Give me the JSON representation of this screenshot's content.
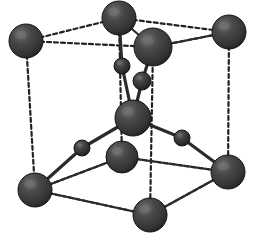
{
  "figure": {
    "name": "crystal-unit-cell-diagram",
    "type": "ball-and-stick-crystal-structure",
    "background_color": "#ffffff",
    "width": 253,
    "height": 237
  },
  "style": {
    "sphere_fill_dark": "#3a3a3a",
    "sphere_fill_mid": "#4a4a4a",
    "sphere_highlight": "#6e6e6e",
    "sphere_shadow": "#1c1c1c",
    "sphere_outline": "#141414",
    "bond_color": "#2b2b2b",
    "edge_dashed_color": "#222222",
    "bond_width": 2.4,
    "edge_width": 2.2,
    "dash_pattern": "4,3"
  },
  "atoms": {
    "large": {
      "label": "large-atom",
      "radius": 17,
      "color": "#3a3a3a",
      "positions": [
        {
          "id": "corner-back-left-top",
          "name": "atom-large-back-left-top",
          "x": 26,
          "y": 41,
          "r": 17
        },
        {
          "id": "corner-back-top",
          "name": "atom-large-back-top",
          "x": 119,
          "y": 18,
          "r": 17
        },
        {
          "id": "corner-back-right-top",
          "name": "atom-large-back-right-top",
          "x": 229,
          "y": 32,
          "r": 17
        },
        {
          "id": "front-top-center",
          "name": "atom-large-front-top-center",
          "x": 153,
          "y": 47,
          "r": 19
        },
        {
          "id": "cell-center",
          "name": "atom-large-center",
          "x": 133,
          "y": 118,
          "r": 18
        },
        {
          "id": "corner-back-left-bottom",
          "name": "atom-large-back-left-bottom",
          "x": 35,
          "y": 190,
          "r": 17
        },
        {
          "id": "corner-mid-bottom",
          "name": "atom-large-mid-bottom",
          "x": 122,
          "y": 157,
          "r": 16
        },
        {
          "id": "corner-front-bottom",
          "name": "atom-large-front-bottom",
          "x": 150,
          "y": 215,
          "r": 17
        },
        {
          "id": "corner-back-right-bottom",
          "name": "atom-large-back-right-bottom",
          "x": 228,
          "y": 172,
          "r": 17
        }
      ]
    },
    "small": {
      "label": "small-atom",
      "radius": 8,
      "color": "#3a3a3a",
      "positions": [
        {
          "id": "small-upper-left",
          "name": "atom-small-upper-left",
          "x": 122,
          "y": 66,
          "r": 8
        },
        {
          "id": "small-upper-right",
          "name": "atom-small-upper-right",
          "x": 142,
          "y": 81,
          "r": 9
        },
        {
          "id": "small-lower-left",
          "name": "atom-small-lower-left",
          "x": 82,
          "y": 148,
          "r": 8
        },
        {
          "id": "small-lower-right",
          "name": "atom-small-lower-right",
          "x": 182,
          "y": 138,
          "r": 8
        }
      ]
    }
  },
  "bonds": {
    "label": "solid-bond",
    "segments": [
      {
        "name": "bond-center-to-small-upper-right",
        "x1": 133,
        "y1": 118,
        "x2": 142,
        "y2": 81
      },
      {
        "name": "bond-small-upper-right-to-front-top",
        "x1": 142,
        "y1": 81,
        "x2": 153,
        "y2": 47
      },
      {
        "name": "bond-center-to-small-upper-left",
        "x1": 133,
        "y1": 118,
        "x2": 122,
        "y2": 66
      },
      {
        "name": "bond-small-upper-left-to-back-top",
        "x1": 122,
        "y1": 66,
        "x2": 119,
        "y2": 18
      },
      {
        "name": "bond-center-to-small-lower-left",
        "x1": 133,
        "y1": 118,
        "x2": 82,
        "y2": 148
      },
      {
        "name": "bond-small-lower-left-to-back-left-bottom",
        "x1": 82,
        "y1": 148,
        "x2": 35,
        "y2": 190
      },
      {
        "name": "bond-center-to-small-lower-right",
        "x1": 133,
        "y1": 118,
        "x2": 182,
        "y2": 138
      },
      {
        "name": "bond-small-lower-right-to-back-right-bottom",
        "x1": 182,
        "y1": 138,
        "x2": 228,
        "y2": 172
      }
    ]
  },
  "cell_edges_solid": {
    "label": "visible-cell-edge",
    "segments": [
      {
        "name": "edge-top-back-to-front-top",
        "x1": 119,
        "y1": 18,
        "x2": 153,
        "y2": 47
      },
      {
        "name": "edge-front-top-to-back-right-top",
        "x1": 153,
        "y1": 47,
        "x2": 229,
        "y2": 32
      },
      {
        "name": "edge-back-left-bottom-to-mid-bottom",
        "x1": 35,
        "y1": 190,
        "x2": 122,
        "y2": 157
      },
      {
        "name": "edge-mid-bottom-to-back-right-bottom",
        "x1": 122,
        "y1": 157,
        "x2": 228,
        "y2": 172
      },
      {
        "name": "edge-back-left-bottom-to-front-bottom",
        "x1": 35,
        "y1": 190,
        "x2": 150,
        "y2": 215
      },
      {
        "name": "edge-front-bottom-to-back-right-bottom",
        "x1": 150,
        "y1": 215,
        "x2": 228,
        "y2": 172
      }
    ]
  },
  "cell_edges_dashed": {
    "label": "hidden-cell-edge",
    "segments": [
      {
        "name": "edge-dashed-back-left-top-to-back-top",
        "x1": 26,
        "y1": 41,
        "x2": 119,
        "y2": 18
      },
      {
        "name": "edge-dashed-back-left-top-to-front-top",
        "x1": 26,
        "y1": 41,
        "x2": 153,
        "y2": 47
      },
      {
        "name": "edge-dashed-front-top-to-back-right-top",
        "x1": 153,
        "y1": 47,
        "x2": 229,
        "y2": 32
      },
      {
        "name": "edge-dashed-back-top-to-back-right-top",
        "x1": 119,
        "y1": 18,
        "x2": 229,
        "y2": 32
      },
      {
        "name": "edge-dashed-vertical-back-left",
        "x1": 26,
        "y1": 41,
        "x2": 35,
        "y2": 190
      },
      {
        "name": "edge-dashed-vertical-back-top",
        "x1": 119,
        "y1": 18,
        "x2": 122,
        "y2": 157
      },
      {
        "name": "edge-dashed-vertical-front-top",
        "x1": 153,
        "y1": 47,
        "x2": 150,
        "y2": 215
      },
      {
        "name": "edge-dashed-vertical-back-right",
        "x1": 229,
        "y1": 32,
        "x2": 228,
        "y2": 172
      },
      {
        "name": "edge-dashed-back-left-bottom-to-mid-bottom",
        "x1": 35,
        "y1": 190,
        "x2": 122,
        "y2": 157
      },
      {
        "name": "edge-dashed-mid-bottom-to-back-right-bottom",
        "x1": 122,
        "y1": 157,
        "x2": 228,
        "y2": 172
      },
      {
        "name": "edge-dashed-back-left-bottom-to-front-bottom",
        "x1": 35,
        "y1": 190,
        "x2": 150,
        "y2": 215
      },
      {
        "name": "edge-dashed-front-bottom-to-back-right-bottom",
        "x1": 150,
        "y1": 215,
        "x2": 228,
        "y2": 172
      }
    ]
  }
}
